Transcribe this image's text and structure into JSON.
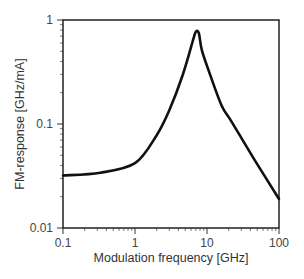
{
  "chart_data": {
    "type": "line",
    "title": "",
    "xlabel": "Modulation frequency [GHz]",
    "ylabel": "FM-response [GHz/mA]",
    "xscale": "log",
    "yscale": "log",
    "xlim": [
      0.1,
      100
    ],
    "ylim": [
      0.01,
      1
    ],
    "xticks": [
      0.1,
      1,
      10,
      100
    ],
    "xtick_labels": [
      "0.1",
      "1",
      "10",
      "100"
    ],
    "yticks": [
      0.01,
      0.1,
      1
    ],
    "ytick_labels": [
      "0.01",
      "0.1",
      "1"
    ],
    "grid": false,
    "legend": null,
    "series": [
      {
        "name": "FM-response",
        "color": "#111111",
        "x": [
          0.1,
          0.33,
          1.0,
          2.0,
          3.0,
          4.6,
          6.4,
          7.0,
          7.7,
          8.5,
          11,
          16,
          22,
          46,
          100
        ],
        "y": [
          0.032,
          0.034,
          0.042,
          0.078,
          0.136,
          0.296,
          0.64,
          0.77,
          0.75,
          0.51,
          0.3,
          0.15,
          0.105,
          0.045,
          0.019
        ]
      }
    ],
    "annotations": []
  }
}
